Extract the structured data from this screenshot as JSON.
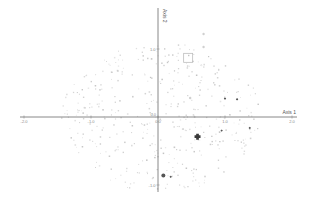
{
  "chart_data": {
    "type": "scatter",
    "title": "",
    "xlabel": "Axis 1",
    "ylabel": "Axis 2",
    "xlim": [
      -2.1,
      2.1
    ],
    "ylim": [
      -1.45,
      1.6
    ],
    "grid": false,
    "legend": null,
    "x_ticks": [
      {
        "value": -2.0,
        "label": "-2.0"
      },
      {
        "value": -1.0,
        "label": "-1.0"
      },
      {
        "value": 0.0,
        "label": "0.0"
      },
      {
        "value": 1.0,
        "label": "1.0"
      },
      {
        "value": 2.0,
        "label": "2.0"
      }
    ],
    "y_ticks": [
      {
        "value": 1.0,
        "label": "1.0"
      },
      {
        "value": -1.0,
        "label": "-1.0"
      }
    ],
    "highlighted_points": [
      {
        "x": 0.45,
        "y": 0.87,
        "marker": "open-square",
        "size": "large",
        "color": "#bdbdbd"
      },
      {
        "x": 0.68,
        "y": 1.22,
        "marker": "circle",
        "size": "small",
        "color": "#d0d0d0"
      },
      {
        "x": 0.68,
        "y": 1.03,
        "marker": "circle",
        "size": "small",
        "color": "#d0d0d0"
      },
      {
        "x": 0.48,
        "y": 0.28,
        "marker": "circle",
        "size": "small",
        "color": "#d0d0d0"
      },
      {
        "x": 1.0,
        "y": 0.27,
        "marker": "filled-diamond",
        "size": "small",
        "color": "#444444"
      },
      {
        "x": 1.18,
        "y": 0.26,
        "marker": "filled-diamond",
        "size": "small",
        "color": "#444444"
      },
      {
        "x": 1.37,
        "y": -0.16,
        "marker": "filled-diamond",
        "size": "small",
        "color": "#444444"
      },
      {
        "x": 0.95,
        "y": -0.2,
        "marker": "filled-diamond",
        "size": "small",
        "color": "#555555"
      },
      {
        "x": 0.59,
        "y": -0.29,
        "marker": "filled-cross",
        "size": "large",
        "color": "#3a3a3a"
      },
      {
        "x": 0.08,
        "y": -0.86,
        "marker": "filled-circle",
        "size": "medium",
        "color": "#555555"
      },
      {
        "x": 0.19,
        "y": -0.88,
        "marker": "filled-diamond",
        "size": "small",
        "color": "#555555"
      }
    ],
    "background_points_note": "approx. 400 faint grey points scattered roughly uniformly within an ellipse centered near the origin (x from -1.4 to 1.5, y from -1.0 to 1.1)"
  }
}
